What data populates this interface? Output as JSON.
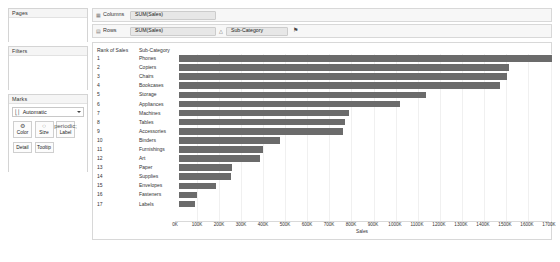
{
  "left_panel": {
    "pages": {
      "title": "Pages"
    },
    "filters": {
      "title": "Filters"
    },
    "marks": {
      "title": "Marks",
      "mark_type": "Automatic",
      "mark_type_icon": "bar-chart-icon",
      "buttons": [
        {
          "label": "Color",
          "icon": "color-palette-icon",
          "glyph": "♙"
        },
        {
          "label": "Size",
          "icon": "size-icon",
          "glyph": "◌"
        },
        {
          "label": "Label",
          "icon": "label-icon",
          "glyph": "⌗"
        }
      ],
      "buttons2": [
        {
          "label": "Detail",
          "icon": "detail-icon"
        },
        {
          "label": "Tooltip",
          "icon": "tooltip-icon"
        }
      ]
    }
  },
  "shelves": {
    "columns": {
      "label": "Columns",
      "icon": "columns-icon",
      "pills": [
        {
          "text": "SUM(Sales)"
        }
      ]
    },
    "rows": {
      "label": "Rows",
      "icon": "rows-icon",
      "pills": [
        {
          "text": "SUM(Sales)"
        },
        {
          "text": "Sub-Category"
        }
      ],
      "sort_glyph": "△",
      "filter_glyph": "⚑"
    }
  },
  "table": {
    "headers": {
      "rank": "Rank of Sales",
      "subcategory": "Sub-Category"
    }
  },
  "chart_data": {
    "type": "bar",
    "title": "",
    "xlabel": "Sales",
    "ylabel": "",
    "orientation": "horizontal",
    "grid": true,
    "legend": "none",
    "xlim": [
      0,
      1700
    ],
    "xticks": [
      "0K",
      "100K",
      "200K",
      "300K",
      "400K",
      "500K",
      "600K",
      "700K",
      "800K",
      "900K",
      "1000K",
      "1100K",
      "1200K",
      "1300K",
      "1400K",
      "1500K",
      "1600K",
      "1700K"
    ],
    "xtick_values": [
      0,
      100,
      200,
      300,
      400,
      500,
      600,
      700,
      800,
      900,
      1000,
      1100,
      1200,
      1300,
      1400,
      1500,
      1600,
      1700
    ],
    "bar_color": "#6b6b6b",
    "rows": [
      {
        "rank": "1",
        "category": "Phones",
        "value": 1705
      },
      {
        "rank": "2",
        "category": "Copiers",
        "value": 1510
      },
      {
        "rank": "3",
        "category": "Chairs",
        "value": 1500
      },
      {
        "rank": "4",
        "category": "Bookcases",
        "value": 1467
      },
      {
        "rank": "5",
        "category": "Storage",
        "value": 1127
      },
      {
        "rank": "6",
        "category": "Appliances",
        "value": 1012
      },
      {
        "rank": "7",
        "category": "Machines",
        "value": 779
      },
      {
        "rank": "8",
        "category": "Tables",
        "value": 757
      },
      {
        "rank": "9",
        "category": "Accessories",
        "value": 750
      },
      {
        "rank": "10",
        "category": "Binders",
        "value": 462
      },
      {
        "rank": "11",
        "category": "Furnishings",
        "value": 385
      },
      {
        "rank": "12",
        "category": "Art",
        "value": 368
      },
      {
        "rank": "13",
        "category": "Paper",
        "value": 244
      },
      {
        "rank": "14",
        "category": "Supplies",
        "value": 239
      },
      {
        "rank": "15",
        "category": "Envelopes",
        "value": 170
      },
      {
        "rank": "16",
        "category": "Fasteners",
        "value": 83
      },
      {
        "rank": "17",
        "category": "Labels",
        "value": 73
      }
    ]
  }
}
